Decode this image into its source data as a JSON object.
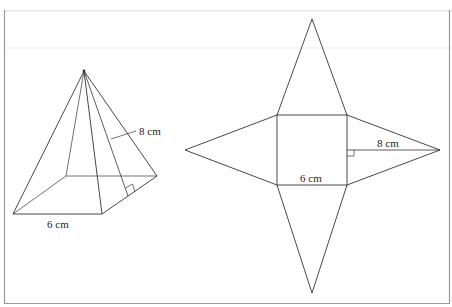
{
  "figure": {
    "pyramid": {
      "slant_height_label": "8 cm",
      "base_side_label": "6 cm"
    },
    "net": {
      "slant_height_label": "8 cm",
      "base_side_label": "6 cm"
    }
  },
  "colors": {
    "line": "#333333",
    "frame": "#999999",
    "faint_rule": "#e4e4e4"
  }
}
